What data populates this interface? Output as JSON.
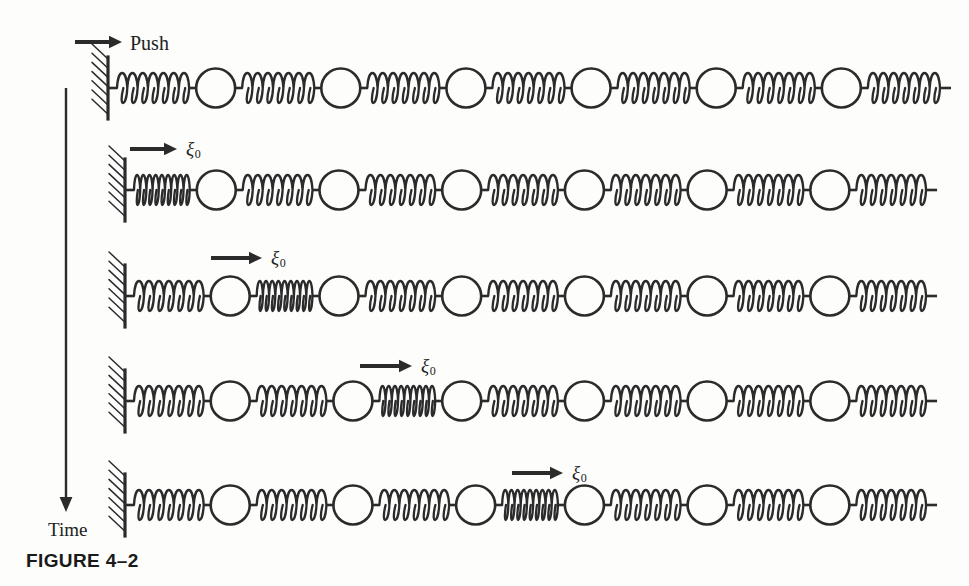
{
  "figure": {
    "caption": "FIGURE 4–2",
    "time_axis_label": "Time",
    "push_label": "Push",
    "displacement_symbol": "ξ",
    "displacement_subscript": "0",
    "line_color": "#2b2b2b",
    "background_color": "#fdfdfc",
    "width": 969,
    "height": 586
  },
  "chart_data": {
    "type": "diagram",
    "title": "FIGURE 4–2",
    "xlabel": "",
    "ylabel": "Time",
    "ylabel_direction": "downward",
    "grid": false,
    "legend": false,
    "annotations": [
      "Push",
      "ξ0",
      "ξ0",
      "ξ0",
      "ξ0",
      "ξ0",
      "Time",
      "FIGURE 4–2"
    ],
    "chain": {
      "masses_per_row": 6,
      "springs_per_row": 7,
      "wall_side": "left",
      "free_end": "right",
      "spring_coils_relaxed": 7,
      "spring_coils_compressed": 9
    },
    "rows": [
      {
        "index": 1,
        "row_label": "Push",
        "label_kind": "push",
        "y": 88,
        "wall_x": 108,
        "compressed_spring_index": null,
        "description": "Undisturbed chain at the instant the wall-end push is applied",
        "arrow": {
          "x1": 75,
          "x2": 122,
          "y": 42,
          "direction": "right"
        },
        "label_x": 130,
        "label_y": 33
      },
      {
        "index": 2,
        "row_label": "ξ0",
        "label_kind": "xi",
        "y": 190,
        "wall_x": 125,
        "compressed_spring_index": 1,
        "description": "First spring compressed; pulse enters the chain",
        "arrow": {
          "x1": 130,
          "x2": 177,
          "y": 149,
          "direction": "right"
        },
        "label_x": 186,
        "label_y": 139
      },
      {
        "index": 3,
        "row_label": "ξ0",
        "label_kind": "xi",
        "y": 296,
        "wall_x": 125,
        "compressed_spring_index": 2,
        "description": "Second spring compressed; pulse advanced one mass",
        "arrow": {
          "x1": 211,
          "x2": 262,
          "y": 258,
          "direction": "right"
        },
        "label_x": 271,
        "label_y": 248
      },
      {
        "index": 4,
        "row_label": "ξ0",
        "label_kind": "xi",
        "y": 401,
        "wall_x": 125,
        "compressed_spring_index": 3,
        "description": "Third spring compressed; pulse advanced two masses",
        "arrow": {
          "x1": 360,
          "x2": 412,
          "y": 366,
          "direction": "right"
        },
        "label_x": 421,
        "label_y": 356
      },
      {
        "index": 5,
        "row_label": "ξ0",
        "label_kind": "xi",
        "y": 505,
        "wall_x": 125,
        "compressed_spring_index": 4,
        "description": "Fourth spring compressed; pulse advanced three masses",
        "arrow": {
          "x1": 512,
          "x2": 563,
          "y": 473,
          "direction": "right"
        },
        "label_x": 572,
        "label_y": 463
      }
    ],
    "time_arrow": {
      "x": 66,
      "y1": 88,
      "y2": 512,
      "direction": "down"
    },
    "time_label_pos": {
      "x": 48,
      "y": 520
    },
    "caption_pos": {
      "x": 26,
      "y": 551
    }
  }
}
